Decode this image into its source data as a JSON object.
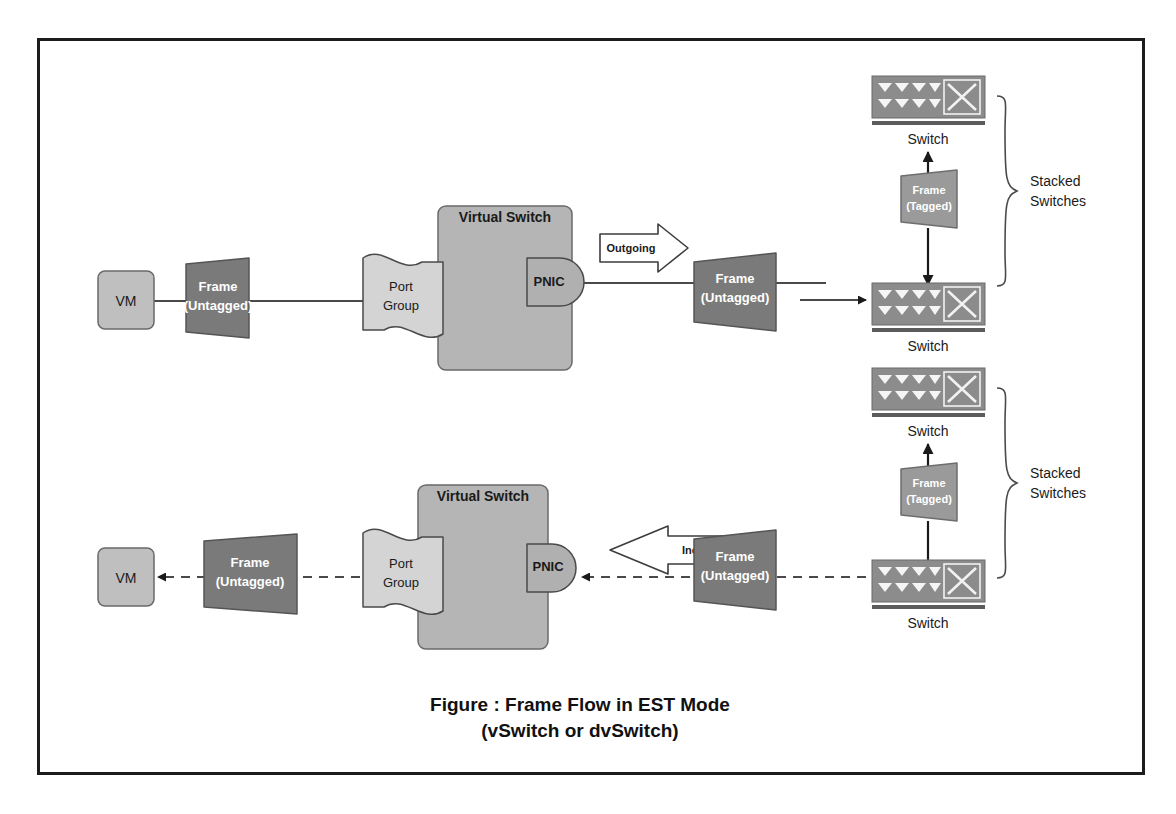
{
  "figure": {
    "caption_line1": "Figure : Frame Flow in EST Mode",
    "caption_line2": "(vSwitch or dvSwitch)",
    "border_color": "#1c1c1c",
    "background": "#ffffff"
  },
  "palette": {
    "vm_fill": "#bfbfbf",
    "frame_untagged_fill": "#7a7a7a",
    "frame_tagged_fill": "#9a9a9a",
    "port_group_fill": "#d4d4d4",
    "virtual_switch_fill": "#b5b5b5",
    "pnic_fill": "#b0b0b0",
    "switch_icon_fill": "#8c8c8c",
    "callout_fill": "#ffffff",
    "stroke": "#4a4a4a",
    "text_dark": "#1a1a1a",
    "text_light": "#ffffff"
  },
  "flows": [
    {
      "id": "outgoing-flow",
      "direction": "outgoing",
      "line_style": "solid",
      "nodes": {
        "vm": {
          "label": "VM"
        },
        "frame_left": {
          "line1": "Frame",
          "line2": "(Untagged)"
        },
        "port_group": {
          "line1": "Port",
          "line2": "Group"
        },
        "virtual_switch": {
          "label": "Virtual Switch"
        },
        "pnic": {
          "label": "PNIC"
        },
        "callout": {
          "label": "Outgoing"
        },
        "frame_right": {
          "line1": "Frame",
          "line2": "(Untagged)"
        },
        "switch_top": {
          "label": "Switch"
        },
        "switch_bottom": {
          "label": "Switch"
        },
        "frame_tagged": {
          "line1": "Frame",
          "line2": "(Tagged)"
        },
        "brace": {
          "line1": "Stacked",
          "line2": "Switches"
        }
      }
    },
    {
      "id": "incoming-flow",
      "direction": "incoming",
      "line_style": "dashed",
      "nodes": {
        "vm": {
          "label": "VM"
        },
        "frame_left": {
          "line1": "Frame",
          "line2": "(Untagged)"
        },
        "port_group": {
          "line1": "Port",
          "line2": "Group"
        },
        "virtual_switch": {
          "label": "Virtual Switch"
        },
        "pnic": {
          "label": "PNIC"
        },
        "callout": {
          "label": "Incoming"
        },
        "frame_right": {
          "line1": "Frame",
          "line2": "(Untagged)"
        },
        "switch_top": {
          "label": "Switch"
        },
        "switch_bottom": {
          "label": "Switch"
        },
        "frame_tagged": {
          "line1": "Frame",
          "line2": "(Tagged)"
        },
        "brace": {
          "line1": "Stacked",
          "line2": "Switches"
        }
      }
    }
  ]
}
